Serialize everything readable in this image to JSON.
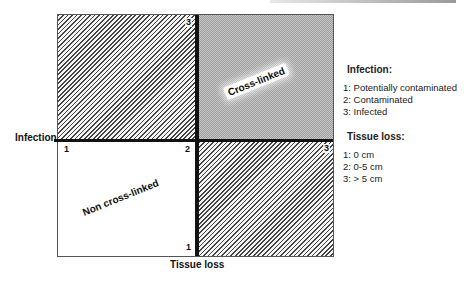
{
  "diagram": {
    "x_axis_label": "Tissue loss",
    "y_axis_label": "Infection",
    "quadrants": {
      "top_left": {
        "fill": "hatched"
      },
      "top_right": {
        "fill": "dotted-gray",
        "label": "Cross-linked"
      },
      "bottom_left": {
        "fill": "white",
        "label": "Non cross-linked"
      },
      "bottom_right": {
        "fill": "hatched"
      }
    },
    "ticks": {
      "top_center": "3",
      "left_center": "1",
      "center": "2",
      "right_center": "3",
      "bottom_center": "1"
    }
  },
  "legend": {
    "infection": {
      "title": "Infection:",
      "items": [
        "1: Potentially contaminated",
        "2: Contaminated",
        "3: Infected"
      ]
    },
    "tissue_loss": {
      "title": "Tissue loss:",
      "items": [
        "1: 0 cm",
        "2: 0-5 cm",
        "3: > 5 cm"
      ]
    }
  }
}
